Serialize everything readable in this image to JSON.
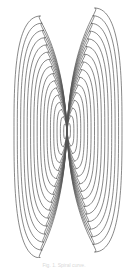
{
  "figure": {
    "type": "spiral-bowtie",
    "center": [
      67,
      131
    ],
    "stroke_color": "#555555",
    "stroke_width": 0.7,
    "loops": 16,
    "lobes": {
      "left": {
        "x_min": 14,
        "top_y": 16,
        "bottom_y": 258
      },
      "right": {
        "x_max": 122,
        "top_y": 8,
        "bottom_y": 252
      }
    },
    "tail_end": [
      113,
      160
    ]
  },
  "caption": {
    "text": "Fig. 1. Spiral curve."
  }
}
